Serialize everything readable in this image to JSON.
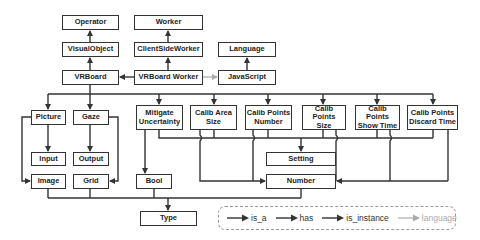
{
  "nodes": {
    "operator": "Operator",
    "worker": "Worker",
    "visual_object": "VisualObject",
    "client_side_worker": "ClientSideWorker",
    "language": "Language",
    "vrboard": "VRBoard",
    "vrboard_worker": "VRBoard Worker",
    "javascript": "JavaScript",
    "picture": "Picture",
    "gaze": "Gaze",
    "mitigate_uncertainty": "Mitigate\nUncertainty",
    "calib_area_size": "Calib Area\nSize",
    "calib_points_number": "Calib Points\nNumber",
    "calib_points_size": "Calib Points\nSize",
    "calib_points_show_time": "Calib Points\nShow Time",
    "calib_points_discard_time": "Calib Points\nDiscard Time",
    "input": "Input",
    "output": "Output",
    "image": "Image",
    "grid": "Grid",
    "bool": "Bool",
    "setting": "Setting",
    "number": "Number",
    "type": "Type"
  },
  "legend": {
    "is_a": "is_a",
    "has": "has",
    "is_instance": "is_instance",
    "language": "language"
  },
  "colors": {
    "line": "#333333",
    "language_line": "#aaaaaa",
    "legend_border": "#999999"
  }
}
